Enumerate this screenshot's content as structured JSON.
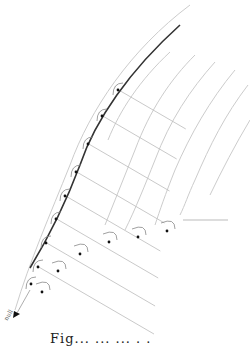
{
  "diagram": {
    "type": "curvilinear-grid-with-right-angle-marks",
    "arrow_label": "null",
    "caption_partial": "Fig...  ...  ... . .",
    "colors": {
      "main_curve": "#333333",
      "grid": "#bbbbbb",
      "outer_arcs": "#cccccc",
      "marks": "#888888",
      "dots": "#111111"
    },
    "num_dots_on_curve": 13,
    "num_dots_on_bottom_edge": 6
  }
}
